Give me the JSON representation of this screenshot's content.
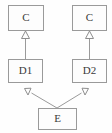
{
  "diagram": {
    "type": "class-diagram",
    "colors": {
      "background": "#fefefe",
      "box_fill": "#fdfdfd",
      "border": "#9a9a9a",
      "text": "#3a3a3a",
      "arrowhead_fill": "#fdfdfd"
    },
    "nodes": [
      {
        "id": "c-left",
        "label": "C",
        "x": 8,
        "y": 5,
        "width": 36,
        "height": 26
      },
      {
        "id": "c-right",
        "label": "C",
        "x": 72,
        "y": 5,
        "width": 35,
        "height": 26
      },
      {
        "id": "d1",
        "label": "D1",
        "x": 8,
        "y": 59,
        "width": 35,
        "height": 24
      },
      {
        "id": "d2",
        "label": "D2",
        "x": 72,
        "y": 59,
        "width": 35,
        "height": 24
      },
      {
        "id": "e",
        "label": "E",
        "x": 38,
        "y": 108,
        "width": 39,
        "height": 22
      }
    ],
    "edges": [
      {
        "id": "d1-to-c-left",
        "from": "d1",
        "to": "c-left",
        "kind": "generalization",
        "arrow": "hollow-triangle"
      },
      {
        "id": "d2-to-c-right",
        "from": "d2",
        "to": "c-right",
        "kind": "generalization",
        "arrow": "hollow-triangle"
      },
      {
        "id": "e-to-d1",
        "from": "e",
        "to": "d1",
        "kind": "generalization",
        "arrow": "hollow-triangle"
      },
      {
        "id": "e-to-d2",
        "from": "e",
        "to": "d2",
        "kind": "generalization",
        "arrow": "hollow-triangle"
      }
    ]
  }
}
